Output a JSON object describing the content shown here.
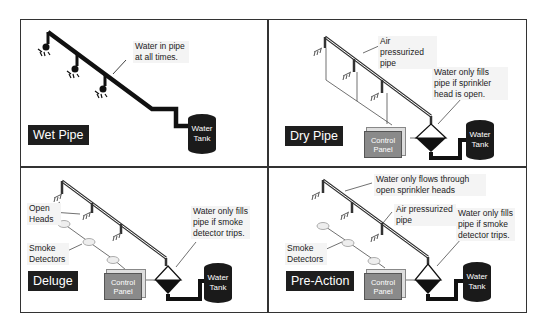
{
  "panels": [
    {
      "id": "wet",
      "title": "Wet Pipe",
      "labels": [
        "Water in pipe at all times."
      ],
      "tank_label": "Water Tank"
    },
    {
      "id": "dry",
      "title": "Dry Pipe",
      "labels": [
        "Air pressurized pipe",
        "Water only fills pipe if sprinkler head is open."
      ],
      "control_panel_label": "Control Panel",
      "tank_label": "Water Tank"
    },
    {
      "id": "deluge",
      "title": "Deluge",
      "labels": [
        "Open Heads",
        "Smoke Detectors",
        "Water only fills pipe if smoke detector trips."
      ],
      "control_panel_label": "Control Panel",
      "tank_label": "Water Tank"
    },
    {
      "id": "preaction",
      "title": "Pre-Action",
      "labels": [
        "Water only flows through open sprinkler heads",
        "Air pressurized pipe",
        "Smoke Detectors",
        "Water only fills pipe if smoke detector trips."
      ],
      "control_panel_label": "Control Panel",
      "tank_label": "Water Tank"
    }
  ],
  "colors": {
    "title_bg": "#1e1e1e",
    "tank": "#1a1a1a",
    "control_panel": "#8a8a8a",
    "border": "#333333"
  }
}
